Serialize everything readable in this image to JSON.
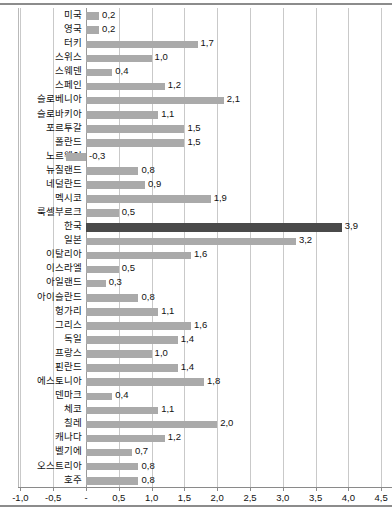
{
  "chart_data": {
    "type": "bar",
    "orientation": "horizontal",
    "title": "",
    "subtitle": "",
    "xlabel": "",
    "ylabel": "",
    "xlim": [
      -1.0,
      4.5
    ],
    "grid": true,
    "legend": null,
    "highlight_category": "한국",
    "colors": {
      "bar": "#aaaaaa",
      "highlight_bar": "#4a4a4a",
      "gridline": "#c9c9c9",
      "zeroline": "#9a9a9a",
      "text": "#111111",
      "frame": "#8c8c8c"
    },
    "xticks": [
      -1.0,
      -0.5,
      0,
      0.5,
      1.0,
      1.5,
      2.0,
      2.5,
      3.0,
      3.5,
      4.0,
      4.5
    ],
    "xticklabels": [
      "-1,0",
      "-0,5",
      "-",
      "0,5",
      "1,0",
      "1,5",
      "2,0",
      "2,5",
      "3,0",
      "3,5",
      "4,0",
      "4,5"
    ],
    "categories": [
      "미국",
      "영국",
      "터키",
      "스위스",
      "스웨덴",
      "스페인",
      "슬로베니아",
      "슬로바키아",
      "포르투갈",
      "폴란드",
      "노르웨이",
      "뉴질랜드",
      "네덜란드",
      "멕시코",
      "룩셀부르크",
      "한국",
      "일본",
      "이탈리아",
      "이스라엘",
      "아일랜드",
      "아이슬란드",
      "헝가리",
      "그리스",
      "독일",
      "프랑스",
      "핀란드",
      "에스토니아",
      "덴마크",
      "체코",
      "칠레",
      "캐나다",
      "벨기에",
      "오스트리아",
      "호주"
    ],
    "values": [
      0.2,
      0.2,
      1.7,
      1.0,
      0.4,
      1.2,
      2.1,
      1.1,
      1.5,
      1.5,
      -0.3,
      0.8,
      0.9,
      1.9,
      0.5,
      3.9,
      3.2,
      1.6,
      0.5,
      0.3,
      0.8,
      1.1,
      1.6,
      1.4,
      1.0,
      1.4,
      1.8,
      0.4,
      1.1,
      2.0,
      1.2,
      0.7,
      0.8,
      0.8
    ],
    "value_labels": [
      "0,2",
      "0,2",
      "1,7",
      "1,0",
      "0,4",
      "1,2",
      "2,1",
      "1,1",
      "1,5",
      "1,5",
      "-0,3",
      "0,8",
      "0,9",
      "1,9",
      "0,5",
      "3,9",
      "3,2",
      "1,6",
      "0,5",
      "0,3",
      "0,8",
      "1,1",
      "1,6",
      "1,4",
      "1,0",
      "1,4",
      "1,8",
      "0,4",
      "1,1",
      "2,0",
      "1,2",
      "0,7",
      "0,8",
      "0,8"
    ]
  }
}
